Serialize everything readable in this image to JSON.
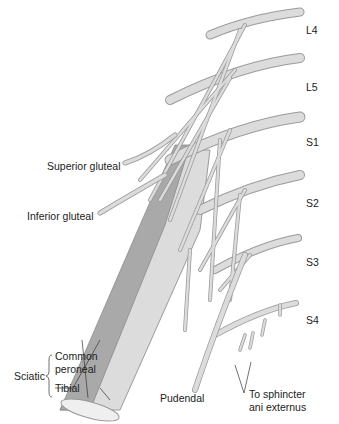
{
  "diagram": {
    "roots": [
      "L4",
      "L5",
      "S1",
      "S2",
      "S3",
      "S4"
    ],
    "branches": {
      "superior_gluteal": "Superior gluteal",
      "inferior_gluteal": "Inferior gluteal",
      "sciatic": "Sciatic",
      "common_peroneal_line1": "Common",
      "common_peroneal_line2": "peroneal",
      "tibial": "Tibial",
      "pudendal": "Pudendal",
      "sphincter_line1": "To sphincter",
      "sphincter_line2": "ani externus"
    },
    "colors": {
      "nerve_light": "#dcdcdc",
      "nerve_outline": "#9a9a9a",
      "nerve_dark": "#a8a8a8",
      "text": "#222222"
    }
  }
}
